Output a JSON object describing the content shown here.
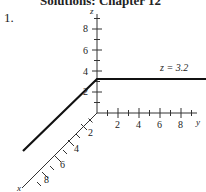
{
  "header": {
    "text": "Solutions: Chapter 12"
  },
  "problem_number": "1.",
  "diagram": {
    "title": "",
    "axes": {
      "x": {
        "label": "x",
        "ticks": [
          "2",
          "4",
          "6",
          "8"
        ]
      },
      "y": {
        "label": "y",
        "ticks": [
          "2",
          "4",
          "6",
          "8"
        ]
      },
      "z": {
        "label": "z",
        "ticks": [
          "2",
          "4",
          "6",
          "8"
        ]
      }
    },
    "annotation": "z = 3.2",
    "line_color": "#111111"
  }
}
